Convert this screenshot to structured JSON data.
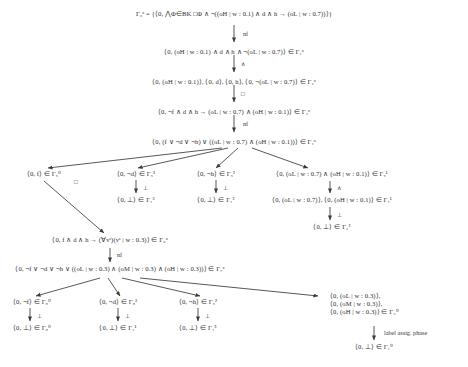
{
  "figure": {
    "kind": "proof-tree",
    "symbols": {
      "and": "∧",
      "or": "∨",
      "not": "¬",
      "implies": "→",
      "box": "□",
      "bottom": "⊥",
      "in": "∈",
      "bigand": "⋀",
      "forall": "∀",
      "downarrow": "↓"
    },
    "nodes": [
      {
        "id": "n0",
        "text": "Γ₀ᵒ = {⟨0, ⋀Φ∈BK □Φ ∧ ¬((oH | w : 0.1) ∧ d ∧ h → (oL | w : 0.7))⟩}"
      },
      {
        "id": "n1",
        "text": "⟨0, (oH | w : 0.1) ∧ d ∧ h ∧ ¬(oL | w : 0.7)⟩ ∈ Γ₁ᵒ"
      },
      {
        "id": "n2",
        "text": "⟨0, (oH | w : 0.1)⟩, ⟨0, d⟩, ⟨0, h⟩, ⟨0, ¬(oL | w : 0.7)⟩ ∈ Γ₂ᵒ"
      },
      {
        "id": "n3",
        "text": "⟨0, ¬f ∧ d ∧ h → (oL | w : 0.7) ∧ (oH | w : 0.1)⟩ ∈ Γ₃ᵒ"
      },
      {
        "id": "n4",
        "text": "⟨0, (f ∨ ¬d ∨ ¬h) ∨ ((oL | w : 0.7) ∧ (oH | w : 0.1))⟩ ∈ Γ₄ᵒ"
      },
      {
        "id": "b1",
        "text": "⟨0, f⟩ ∈ Γ₅⁰"
      },
      {
        "id": "b2",
        "text": "⟨0, ¬d⟩ ∈ Γ₅³"
      },
      {
        "id": "b3",
        "text": "⟨0, ¬h⟩ ∈ Γ₅²"
      },
      {
        "id": "b4",
        "text": "⟨0, (oL | w : 0.7) ∧ (oH | w : 0.1)⟩ ∈ Γ₅¹"
      },
      {
        "id": "b2c",
        "text": "⟨0, ⊥⟩ ∈ Γ₁³"
      },
      {
        "id": "b3c",
        "text": "⟨0, ⊥⟩ ∈ Γ₁²"
      },
      {
        "id": "b4a",
        "text": "⟨0, (oL | w : 0.7)⟩, ⟨0, (oH | w : 0.1)⟩ ∈ Γ₁¹"
      },
      {
        "id": "b4b",
        "text": "⟨0, ⊥⟩ ∈ Γ₂²"
      },
      {
        "id": "n6",
        "text": "⟨0, f ∧ d ∧ h → (∀vˢ)(vˢ | w : 0.3)⟩ ∈ Γ₆ᵒ"
      },
      {
        "id": "n7",
        "text": "⟨0, ¬f ∨ ¬d ∨ ¬h ∨ ((oL | w : 0.3) ∧ (oM | w : 0.3) ∧ (oH | w : 0.3))⟩ ∈ Γ₇ᵒ"
      },
      {
        "id": "c1",
        "text": "⟨0, ¬f⟩ ∈ Γ₈⁰"
      },
      {
        "id": "c2",
        "text": "⟨0, ¬d⟩ ∈ Γ₈³"
      },
      {
        "id": "c3",
        "text": "⟨0, ¬h⟩ ∈ Γ₅²"
      },
      {
        "id": "c4",
        "text": "⟨0, (oL | w : 0.3)⟩,"
      },
      {
        "id": "c4b",
        "text": "⟨0, (oM | w : 0.3)⟩,"
      },
      {
        "id": "c4c",
        "text": "⟨0, (oH | w : 0.3)⟩ ∈ Γ₃⁰"
      },
      {
        "id": "c1c",
        "text": "⟨0, ⊥⟩ ∈ Γ₉⁰"
      },
      {
        "id": "c2c",
        "text": "⟨0, ⊥⟩ ∈ Γ₄¹"
      },
      {
        "id": "c3c",
        "text": "⟨0, ⊥⟩ ∈ Γ₁⁵"
      },
      {
        "id": "c4d",
        "text": "⟨0, ⊥⟩ ∈ Γ₁⁰"
      }
    ],
    "edge_labels": [
      {
        "id": "e0",
        "text": "nf"
      },
      {
        "id": "e1",
        "text": "∧"
      },
      {
        "id": "e2",
        "text": "□"
      },
      {
        "id": "e3",
        "text": "nf"
      },
      {
        "id": "e4",
        "text": "□"
      },
      {
        "id": "e5",
        "text": "⊥"
      },
      {
        "id": "e6",
        "text": "⊥"
      },
      {
        "id": "e7",
        "text": "∧"
      },
      {
        "id": "e8",
        "text": "⊥"
      },
      {
        "id": "e9",
        "text": "nf"
      },
      {
        "id": "e10",
        "text": "⊥"
      },
      {
        "id": "e11",
        "text": "⊥"
      },
      {
        "id": "e12",
        "text": "⊥"
      },
      {
        "id": "e13",
        "text": "label assig. phase"
      }
    ]
  }
}
